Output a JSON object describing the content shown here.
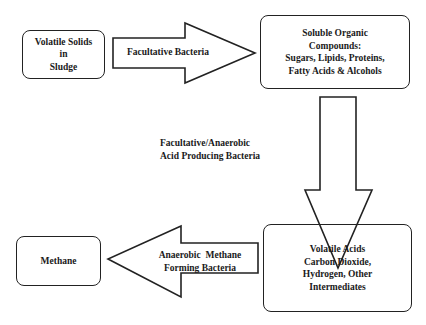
{
  "diagram": {
    "type": "process-flow",
    "nodes": [
      {
        "id": "volatile-solids",
        "lines": [
          "Volatile Solids",
          "in",
          "Sludge"
        ]
      },
      {
        "id": "soluble-organic",
        "lines": [
          "Soluble Organic",
          "Compounds:",
          "Sugars, Lipids, Proteins,",
          "Fatty Acids & Alcohols"
        ]
      },
      {
        "id": "volatile-acids",
        "lines": [
          "Volatile Acids",
          "Carbon Dioxide,",
          "Hydrogen, Other",
          "Intermediates"
        ]
      },
      {
        "id": "methane",
        "lines": [
          "Methane"
        ]
      }
    ],
    "edges": [
      {
        "from": "volatile-solids",
        "to": "soluble-organic",
        "lines": [
          "Facultative Bacteria"
        ]
      },
      {
        "from": "soluble-organic",
        "to": "volatile-acids",
        "lines": [
          "Facultative/Anaerobic",
          "Acid Producing Bacteria"
        ]
      },
      {
        "from": "volatile-acids",
        "to": "methane",
        "lines": [
          "Anaerobic  Methane",
          "Forming Bacteria"
        ]
      }
    ]
  }
}
